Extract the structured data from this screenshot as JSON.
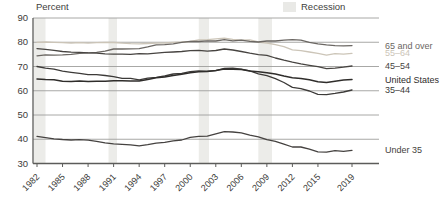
{
  "header": {
    "y_axis_title": "Percent",
    "recession_label": "Recession"
  },
  "chart_data": {
    "type": "line",
    "title": "",
    "ylabel": "Percent",
    "xlabel": "",
    "ylim": [
      30,
      90
    ],
    "ytick_step": 10,
    "grid": true,
    "legend_position": "right",
    "x": [
      1982,
      1983,
      1984,
      1985,
      1986,
      1987,
      1988,
      1989,
      1990,
      1991,
      1992,
      1993,
      1994,
      1995,
      1996,
      1997,
      1998,
      1999,
      2000,
      2001,
      2002,
      2003,
      2004,
      2005,
      2006,
      2007,
      2008,
      2009,
      2010,
      2011,
      2012,
      2013,
      2014,
      2015,
      2016,
      2017,
      2018,
      2019
    ],
    "xtick_labels": [
      "1982",
      "1985",
      "1988",
      "1991",
      "1994",
      "1997",
      "2000",
      "2003",
      "2006",
      "2009",
      "2012",
      "2015",
      "2019"
    ],
    "series": [
      {
        "name": "65 and over",
        "color": "#6b6763",
        "values": [
          74.4,
          74.8,
          74.7,
          74.8,
          75.0,
          75.4,
          75.6,
          75.8,
          76.3,
          77.2,
          77.2,
          77.3,
          77.4,
          78.1,
          78.9,
          79.0,
          79.3,
          80.0,
          80.4,
          80.3,
          80.6,
          80.5,
          81.1,
          80.6,
          80.9,
          80.4,
          80.1,
          80.5,
          80.5,
          80.9,
          81.1,
          80.9,
          80.0,
          79.3,
          78.9,
          78.6,
          78.5,
          78.6
        ]
      },
      {
        "name": "55–64",
        "color": "#ccc5b8",
        "values": [
          80.0,
          80.1,
          80.0,
          79.8,
          79.7,
          79.8,
          79.6,
          79.8,
          79.9,
          79.9,
          79.6,
          79.4,
          79.3,
          79.5,
          79.6,
          79.7,
          80.0,
          80.1,
          80.3,
          81.0,
          81.1,
          81.4,
          81.7,
          81.2,
          80.9,
          81.0,
          80.1,
          79.7,
          79.0,
          78.2,
          76.9,
          76.5,
          76.0,
          75.4,
          74.7,
          75.3,
          75.1,
          75.4
        ]
      },
      {
        "name": "45–54",
        "color": "#474441",
        "values": [
          77.4,
          77.1,
          76.7,
          76.2,
          75.9,
          75.8,
          75.6,
          75.5,
          75.2,
          75.1,
          75.1,
          75.0,
          75.3,
          75.2,
          75.5,
          75.8,
          76.0,
          76.2,
          76.5,
          76.7,
          76.3,
          76.6,
          77.2,
          76.8,
          76.2,
          75.5,
          74.9,
          74.6,
          73.5,
          72.6,
          71.8,
          71.1,
          70.5,
          69.9,
          69.1,
          69.3,
          69.7,
          70.2
        ]
      },
      {
        "name": "United States",
        "color": "#2f2d2b",
        "values": [
          64.8,
          64.6,
          64.5,
          63.9,
          63.8,
          64.0,
          63.8,
          63.9,
          63.9,
          64.1,
          64.1,
          64.0,
          64.0,
          64.7,
          65.4,
          65.7,
          66.3,
          66.8,
          67.4,
          67.8,
          67.9,
          68.3,
          69.0,
          68.9,
          68.8,
          68.1,
          67.8,
          67.4,
          66.9,
          66.1,
          65.4,
          65.1,
          64.5,
          63.7,
          63.4,
          63.9,
          64.4,
          64.6
        ]
      },
      {
        "name": "35–44",
        "color": "#3c3a38",
        "values": [
          70.0,
          69.3,
          68.9,
          68.1,
          67.6,
          67.2,
          66.6,
          66.6,
          66.3,
          65.8,
          65.1,
          65.1,
          64.5,
          65.2,
          65.5,
          66.1,
          66.9,
          67.2,
          67.9,
          68.2,
          68.1,
          68.3,
          69.2,
          69.3,
          68.9,
          68.2,
          67.0,
          66.2,
          65.0,
          63.4,
          61.4,
          60.9,
          59.9,
          58.5,
          58.4,
          58.9,
          59.5,
          60.3
        ]
      },
      {
        "name": "Under 35",
        "color": "#454240",
        "values": [
          41.2,
          40.7,
          40.2,
          39.9,
          39.7,
          39.8,
          39.6,
          39.1,
          38.5,
          38.1,
          37.9,
          37.7,
          37.3,
          37.8,
          38.4,
          38.7,
          39.3,
          39.7,
          40.8,
          41.2,
          41.3,
          42.2,
          43.1,
          43.0,
          42.6,
          41.7,
          41.0,
          39.8,
          39.1,
          38.0,
          36.8,
          36.8,
          35.9,
          34.8,
          34.7,
          35.3,
          35.0,
          35.4
        ]
      }
    ],
    "recessions": [
      [
        1981.6,
        1983.0
      ],
      [
        1990.4,
        1991.4
      ],
      [
        2001.0,
        2002.2
      ],
      [
        2008.0,
        2009.6
      ]
    ],
    "recession_band_color": "#ececE9",
    "grid_color": "#9e9e9c",
    "axis_line_color": "#5c5c5a",
    "axis_text_color": "#3b3b39"
  }
}
